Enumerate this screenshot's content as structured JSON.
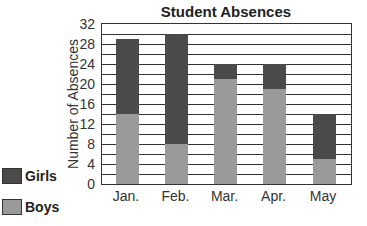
{
  "chart_data": {
    "type": "bar",
    "stacked": true,
    "title": "Student Absences",
    "xlabel": "",
    "ylabel": "Number of Absences",
    "categories": [
      "Jan.",
      "Feb.",
      "Mar.",
      "Apr.",
      "May"
    ],
    "series": [
      {
        "name": "Boys",
        "color": "#9a9a9a",
        "values": [
          14,
          8,
          21,
          19,
          5
        ]
      },
      {
        "name": "Girls",
        "color": "#4a4a4a",
        "values": [
          15,
          22,
          3,
          5,
          9
        ]
      }
    ],
    "totals": [
      29,
      30,
      24,
      24,
      14
    ],
    "ylim": [
      0,
      32
    ],
    "yticks": [
      0,
      4,
      8,
      12,
      16,
      20,
      24,
      28,
      32
    ],
    "grid": {
      "horizontal": true,
      "step": 2
    },
    "legend": {
      "position": "left-bottom",
      "entries": [
        "Girls",
        "Boys"
      ]
    }
  }
}
